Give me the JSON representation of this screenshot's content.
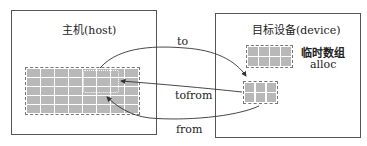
{
  "host": {
    "title": "主机(host)",
    "grid": {
      "cols": 8,
      "rows": 5
    }
  },
  "device": {
    "title": "目标设备(device)",
    "alloc_array": {
      "cols": 4,
      "rows": 2,
      "label_cn": "临时数组",
      "label_en": "alloc"
    },
    "tofrom_array": {
      "cols": 3,
      "rows": 2
    }
  },
  "arrows": [
    {
      "label": "to",
      "direction": "host-to-device"
    },
    {
      "label": "tofrom",
      "direction": "device-to-host"
    },
    {
      "label": "from",
      "direction": "device-to-host"
    }
  ],
  "colors": {
    "cell": "#b8b8b8",
    "border": "#555555",
    "line": "#333333"
  }
}
